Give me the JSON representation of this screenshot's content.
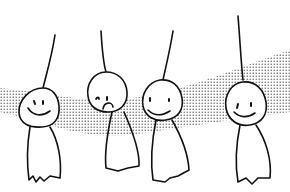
{
  "illustration": {
    "subject": "Four teru teru bozu dolls hanging in a row over a dotted halftone band",
    "background_color": "#ffffff",
    "line_color": "#111111",
    "dot_color": "#555555",
    "figures": [
      {
        "name": "doll-1",
        "expression": "smile"
      },
      {
        "name": "doll-2",
        "expression": "sad"
      },
      {
        "name": "doll-3",
        "expression": "smile"
      },
      {
        "name": "doll-4",
        "expression": "smile"
      }
    ]
  }
}
